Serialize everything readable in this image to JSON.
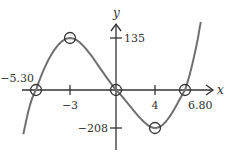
{
  "chart_data": {
    "type": "line",
    "title": "",
    "xlabel": "x",
    "ylabel": "y",
    "grid": false,
    "legend": "none",
    "series": [
      {
        "name": "curve",
        "points": [
          {
            "x": -5.3,
            "y": 0,
            "label": "-5.30",
            "kind": "x-intercept"
          },
          {
            "x": -3,
            "y": 135,
            "label": "-3",
            "kind": "local-max"
          },
          {
            "x": 0,
            "y": 0,
            "label": "0",
            "kind": "intercept"
          },
          {
            "x": 4,
            "y": -208,
            "label": "4",
            "kind": "local-min"
          },
          {
            "x": 6.8,
            "y": 0,
            "label": "6.80",
            "kind": "x-intercept"
          }
        ]
      }
    ],
    "x_ticks": [
      {
        "value": -3,
        "label": "−3"
      },
      {
        "value": 4,
        "label": "4"
      }
    ],
    "y_ticks": [
      {
        "value": 135,
        "label": "135"
      },
      {
        "value": -208,
        "label": "−208"
      }
    ],
    "annotations": [
      {
        "x": -5.3,
        "label": "−5.30"
      },
      {
        "x": 6.8,
        "label": "6.80"
      }
    ],
    "colors": {
      "curve": "#707070",
      "axis": "#333333"
    }
  }
}
